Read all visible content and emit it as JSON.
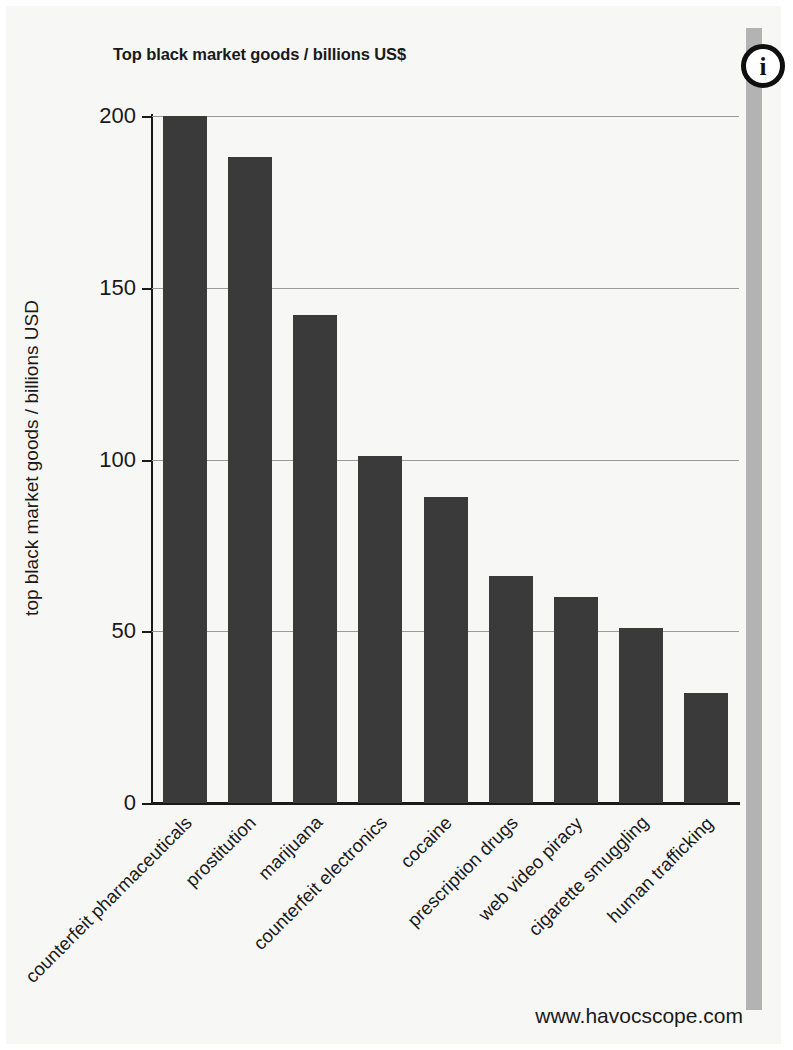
{
  "page": {
    "info_icon_glyph": "i",
    "info_icon_name": "info-icon",
    "footer_url": "www.havocscope.com",
    "right_band_color": "#b3b3b3",
    "background_color": "#f7f7f5",
    "bar_color": "#3a3a3a",
    "axis_color": "#1a1a1a",
    "gridline_color": "#9a9a9a"
  },
  "chart_data": {
    "type": "bar",
    "title": "Top black market goods / billions US$",
    "xlabel": "",
    "ylabel": "top black market goods / billions USD",
    "ylim": [
      0,
      200
    ],
    "yticks": [
      0,
      50,
      100,
      150,
      200
    ],
    "ytick_labels": [
      "0",
      "50",
      "100",
      "150",
      "200"
    ],
    "grid": true,
    "legend": "none",
    "categories": [
      "counterfeit pharmaceuticals",
      "prostitution",
      "marijuana",
      "counterfeit electronics",
      "cocaine",
      "prescription drugs",
      "web video piracy",
      "cigarette smuggling",
      "human trafficking"
    ],
    "values": [
      200,
      188,
      142,
      101,
      89,
      66,
      60,
      51,
      32
    ],
    "units": "billions USD"
  }
}
